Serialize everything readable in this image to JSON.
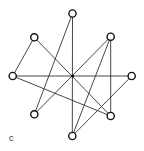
{
  "figure": {
    "label": "c",
    "colors": {
      "edge": "#333333",
      "node_stroke": "#111111",
      "node_fill": "#ffffff"
    },
    "nodes": [
      {
        "id": "top",
        "x": 72.5,
        "y": 13.5
      },
      {
        "id": "upper-left",
        "x": 34.3,
        "y": 37.3
      },
      {
        "id": "upper-right",
        "x": 110.7,
        "y": 36.7
      },
      {
        "id": "left",
        "x": 12.7,
        "y": 76
      },
      {
        "id": "right",
        "x": 131.7,
        "y": 76
      },
      {
        "id": "lower-left",
        "x": 34.3,
        "y": 114.3
      },
      {
        "id": "lower-right",
        "x": 110.7,
        "y": 116
      },
      {
        "id": "bottom",
        "x": 72.3,
        "y": 136
      }
    ],
    "hub": {
      "x": 72.6,
      "y": 76
    },
    "edges": [
      [
        "upper-left",
        "left"
      ],
      [
        "upper-left",
        "lower-right"
      ],
      [
        "top",
        "lower-left"
      ],
      [
        "top",
        "bottom"
      ],
      [
        "left",
        "right"
      ],
      [
        "left",
        "lower-right"
      ],
      [
        "upper-right",
        "lower-left"
      ],
      [
        "upper-right",
        "bottom"
      ],
      [
        "upper-right",
        "lower-right"
      ],
      [
        "right",
        "bottom"
      ]
    ]
  }
}
